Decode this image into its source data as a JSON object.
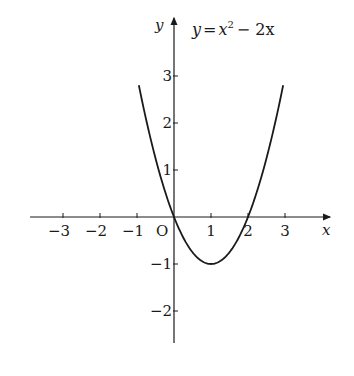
{
  "chart_data": {
    "type": "line",
    "equation": {
      "prefix": "y",
      "eq": "=",
      "x": "x",
      "exp": "2",
      "rest": "− 2x"
    },
    "xlabel": "x",
    "ylabel": "y",
    "origin_label": "O",
    "xlim": [
      -3.8,
      4.4
    ],
    "ylim": [
      -2.6,
      3.8
    ],
    "x_ticks": [
      -3,
      -2,
      -1,
      1,
      2,
      3
    ],
    "x_tick_labels": [
      "−3",
      "−2",
      "−1",
      "1",
      "2",
      "3"
    ],
    "y_ticks": [
      3,
      2,
      1,
      -1,
      -2
    ],
    "y_tick_labels": [
      "3",
      "2",
      "1",
      "−1",
      "−2"
    ],
    "grid": false,
    "series": [
      {
        "name": "y = x^2 - 2x",
        "x": [
          -0.9,
          -0.5,
          0,
          0.5,
          1,
          1.5,
          2,
          2.5,
          2.9
        ],
        "y": [
          2.61,
          1.25,
          0,
          -0.75,
          -1,
          -0.75,
          0,
          1.25,
          2.61
        ]
      }
    ],
    "key_points": [
      {
        "label": "vertex",
        "x": 1,
        "y": -1
      },
      {
        "label": "root",
        "x": 0,
        "y": 0
      },
      {
        "label": "root",
        "x": 2,
        "y": 0
      }
    ]
  }
}
